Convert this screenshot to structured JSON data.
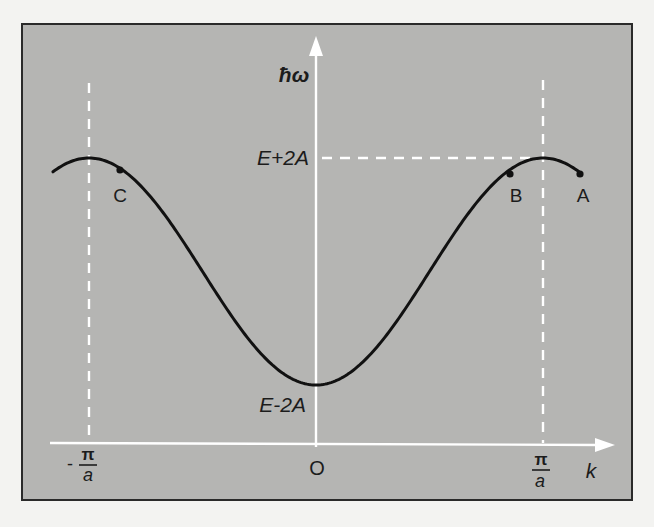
{
  "figure": {
    "background_color": "#b5b5b3",
    "axis_color": "#ffffff",
    "curve_color": "#111111",
    "y_axis_label": "ħω",
    "x_axis_label": "k",
    "origin_label": "O",
    "upper_level_label": "E+2A",
    "lower_level_label": "E-2A",
    "left_boundary_label": {
      "sign": "-",
      "numerator": "π",
      "denominator": "a"
    },
    "right_boundary_label": {
      "numerator": "π",
      "denominator": "a"
    },
    "points": [
      {
        "id": "A",
        "label": "A"
      },
      {
        "id": "B",
        "label": "B"
      },
      {
        "id": "C",
        "label": "C"
      }
    ]
  },
  "chart_data": {
    "type": "line",
    "title": "",
    "xlabel": "k",
    "ylabel": "ħω",
    "x_ticks": [
      "-π/a",
      "0",
      "π/a"
    ],
    "y_ticks": [
      "E-2A",
      "E+2A"
    ],
    "series": [
      {
        "name": "ħω(k)",
        "formula": "E - 2A cos(ka)",
        "x_range_in_units_of_pi_over_a": [
          -1.16,
          1.16
        ],
        "min": {
          "k": "0",
          "value": "E-2A"
        },
        "max": [
          {
            "k": "-π/a",
            "value": "E+2A"
          },
          {
            "k": "π/a",
            "value": "E+2A"
          }
        ]
      }
    ],
    "marked_points": [
      {
        "label": "C",
        "k_in_units_of_pi_over_a": -0.86
      },
      {
        "label": "B",
        "k_in_units_of_pi_over_a": 0.86
      },
      {
        "label": "A",
        "k_in_units_of_pi_over_a": 1.16
      }
    ],
    "reference_lines": [
      {
        "type": "vertical",
        "at": "-π/a",
        "style": "dashed"
      },
      {
        "type": "vertical",
        "at": "π/a",
        "style": "dashed"
      },
      {
        "type": "horizontal",
        "at": "E+2A",
        "style": "dashed",
        "from": "0",
        "to": "π/a"
      }
    ],
    "grid": false,
    "legend": null
  }
}
